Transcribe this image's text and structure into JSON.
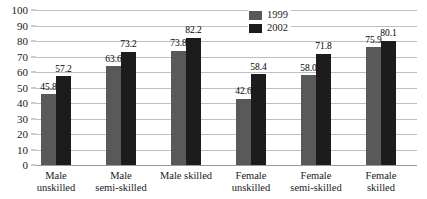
{
  "chart_data": {
    "type": "bar",
    "title": "",
    "xlabel": "",
    "ylabel": "",
    "ylim": [
      0,
      100
    ],
    "ytick_step": 10,
    "yticks": [
      "100",
      "90",
      "80",
      "70",
      "60",
      "50",
      "40",
      "30",
      "20",
      "10",
      "0"
    ],
    "grid": true,
    "legend_position": "top-right",
    "categories": [
      "Male\nunskilled",
      "Male\nsemi-skilled",
      "Male skilled",
      "Female\nunskilled",
      "Female\nsemi-skilled",
      "Female\nskilled"
    ],
    "series": [
      {
        "name": "1999",
        "color": "#595959",
        "values": [
          45.8,
          63.6,
          73.8,
          42.6,
          58.0,
          75.9
        ],
        "labels": [
          "45.8",
          "63.6",
          "73.8",
          "42.6",
          "58.0",
          "75.9"
        ]
      },
      {
        "name": "2002",
        "color": "#1c1c1c",
        "values": [
          57.2,
          73.2,
          82.2,
          58.4,
          71.8,
          80.1
        ],
        "labels": [
          "57.2",
          "73.2",
          "82.2",
          "58.4",
          "71.8",
          "80.1"
        ]
      }
    ]
  },
  "legend": {
    "items": [
      {
        "label": "1999"
      },
      {
        "label": "2002"
      }
    ]
  }
}
